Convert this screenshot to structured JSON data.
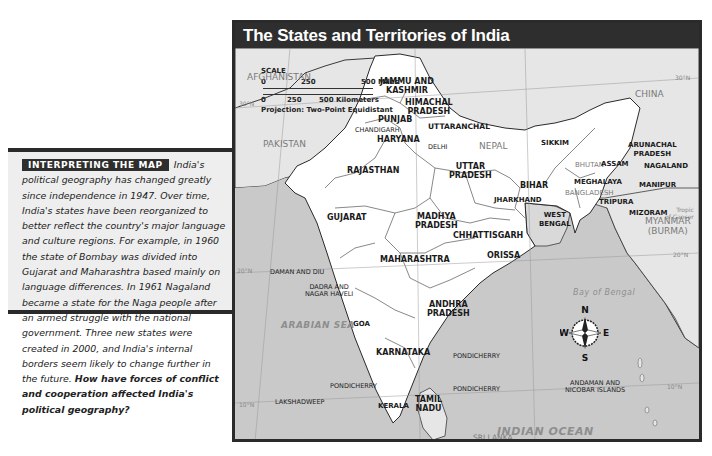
{
  "info_box": {
    "tag": "INTERPRETING THE MAP",
    "body": "India's political geography has changed greatly since independence in 1947. Over time, India's states have been reorganized to better reflect the country's major language and culture regions. For example, in 1960 the state of Bombay was divided into Gujarat and Maharashtra based mainly on language differences. In 1961 Nagaland became a state for the Naga people after an armed struggle with the national government. Three new states were created in 2000, and India's internal borders seem likely to change further in the future.",
    "question": "How have forces of conflict and cooperation affected India's political geography?"
  },
  "map": {
    "title": "The States and Territories of India",
    "colors": {
      "title_bar": "#2e2e2e",
      "land_india": "#ffffff",
      "land_other": "#e6e6e6",
      "water": "#c9c9c9",
      "border": "#2a2a2a"
    },
    "scale": {
      "heading": "SCALE",
      "miles": {
        "ticks": [
          "0",
          "250",
          "500 Miles"
        ]
      },
      "km": {
        "ticks": [
          "0",
          "250",
          "500 Kilometers"
        ]
      },
      "projection": "Projection: Two-Point Equidistant"
    },
    "states": [
      {
        "name": "JAMMU AND KASHMIR",
        "l1": "JAMMU AND",
        "l2": "KASHMIR"
      },
      {
        "name": "HIMACHAL PRADESH",
        "l1": "HIMACHAL",
        "l2": "PRADESH"
      },
      {
        "name": "PUNJAB"
      },
      {
        "name": "HARYANA"
      },
      {
        "name": "UTTARANCHAL"
      },
      {
        "name": "RAJASTHAN"
      },
      {
        "name": "UTTAR PRADESH",
        "l1": "UTTAR",
        "l2": "PRADESH"
      },
      {
        "name": "BIHAR"
      },
      {
        "name": "SIKKIM"
      },
      {
        "name": "ARUNACHAL PRADESH",
        "l1": "ARUNACHAL",
        "l2": "PRADESH"
      },
      {
        "name": "ASSAM"
      },
      {
        "name": "NAGALAND"
      },
      {
        "name": "MEGHALAYA"
      },
      {
        "name": "MANIPUR"
      },
      {
        "name": "TRIPURA"
      },
      {
        "name": "MIZORAM"
      },
      {
        "name": "GUJARAT"
      },
      {
        "name": "MADHYA PRADESH",
        "l1": "MADHYA",
        "l2": "PRADESH"
      },
      {
        "name": "JHARKHAND"
      },
      {
        "name": "WEST BENGAL",
        "l1": "WEST",
        "l2": "BENGAL"
      },
      {
        "name": "CHHATTISGARH"
      },
      {
        "name": "ORISSA"
      },
      {
        "name": "MAHARASHTRA"
      },
      {
        "name": "ANDHRA PRADESH",
        "l1": "ANDHRA",
        "l2": "PRADESH"
      },
      {
        "name": "GOA"
      },
      {
        "name": "KARNATAKA"
      },
      {
        "name": "KERALA"
      },
      {
        "name": "TAMIL NADU",
        "l1": "TAMIL",
        "l2": "NADU"
      }
    ],
    "territories": {
      "chandigarh": "CHANDIGARH",
      "delhi": "DELHI",
      "daman_diu": "DAMAN AND DIU",
      "dadra_l1": "DADRA AND",
      "dadra_l2": "NAGAR HAVELI",
      "pondicherry": "PONDICHERRY",
      "lakshadweep": "LAKSHADWEEP",
      "andaman_l1": "ANDAMAN AND",
      "andaman_l2": "NICOBAR ISLANDS"
    },
    "countries": {
      "afghanistan": "AFGHANISTAN",
      "pakistan": "PAKISTAN",
      "china": "CHINA",
      "nepal": "NEPAL",
      "bhutan": "BHUTAN",
      "bangladesh": "BANGLADESH",
      "myanmar_l1": "MYANMAR",
      "myanmar_l2": "(BURMA)",
      "sri_lanka": "SRI LANKA"
    },
    "water_bodies": {
      "arabian_sea": "ARABIAN SEA",
      "bay_of_bengal": "Bay of Bengal",
      "indian_ocean": "INDIAN OCEAN"
    },
    "graticule": {
      "lat_30": "30°N",
      "lat_20": "20°N",
      "lat_10": "10°N",
      "tropic_l1": "Tropic",
      "tropic_l2": "of Cancer",
      "lon_70": "70°E",
      "lon_80": "80°E",
      "lon_90": "90°E"
    },
    "compass": {
      "n": "N",
      "s": "S",
      "e": "E",
      "w": "W"
    }
  }
}
